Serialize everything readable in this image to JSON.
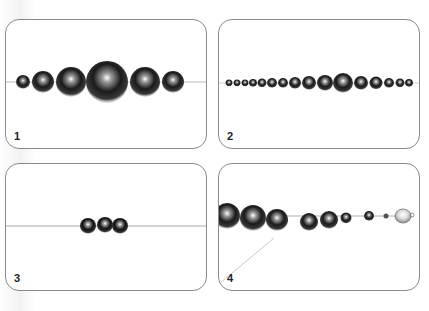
{
  "figure": {
    "panels": [
      {
        "step": "1",
        "caption": "Graduated beads strung on thread"
      },
      {
        "step": "2",
        "caption": "Full graduated strand of beads"
      },
      {
        "step": "3",
        "caption": "Three beads strung on thread"
      },
      {
        "step": "4",
        "caption": "Beads and clasp attached at end"
      }
    ]
  },
  "colors": {
    "border": "#8a8a8a",
    "bead_dark": "#1a1a1a",
    "bead_highlight": "#ffffff",
    "thread": "#bdbdbd"
  }
}
